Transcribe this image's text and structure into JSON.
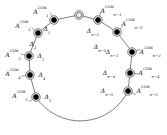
{
  "figure": {
    "kind": "ring-cycle-diagram",
    "width": 167,
    "height": 135,
    "background": "#ffffff",
    "stroke_color": "#555555",
    "node_fill": "#000000",
    "node_ring_color": "#333333",
    "text_color": "#111111"
  },
  "origin": {
    "name": "origin-node",
    "style": "hollow-double-circle",
    "cx": 79,
    "cy": 15,
    "label": ""
  },
  "nodes": [
    {
      "id": "a1",
      "cx": 54,
      "cy": 20,
      "style": "filled-ringed",
      "base": "A",
      "sub": "1",
      "sup": "COM",
      "label_dx": -13,
      "label_dy": -8
    },
    {
      "id": "a2",
      "cx": 38,
      "cy": 33,
      "style": "filled-ringed",
      "base": "A",
      "sub": "2",
      "sup": "COM",
      "label_dx": -15,
      "label_dy": -7
    },
    {
      "id": "a3",
      "cx": 29,
      "cy": 56,
      "style": "filled-ringed",
      "base": "A",
      "sub": "3",
      "sup": "COM",
      "label_dx": -16,
      "label_dy": -1
    },
    {
      "id": "a4",
      "cx": 30,
      "cy": 75,
      "style": "filled-ringed",
      "base": "A",
      "sub": "4",
      "sup": "COM",
      "label_dx": -17,
      "label_dy": -1
    },
    {
      "id": "a5",
      "cx": 36,
      "cy": 97,
      "style": "filled-ringed",
      "base": "A",
      "sub": "5",
      "sup": "COM",
      "label_dx": -16,
      "label_dy": -1
    },
    {
      "id": "an1",
      "cx": 98,
      "cy": 20,
      "style": "filled-ringed",
      "base": "A",
      "sub": "n−1",
      "sup": "COM",
      "label_dx": 13,
      "label_dy": -9
    },
    {
      "id": "an2",
      "cx": 117,
      "cy": 32,
      "style": "filled-ringed",
      "base": "A",
      "sub": "n−2",
      "sup": "COM",
      "label_dx": 15,
      "label_dy": -8
    },
    {
      "id": "an3",
      "cx": 132,
      "cy": 52,
      "style": "filled-ringed",
      "base": "A",
      "sub": "n−3",
      "sup": "COM",
      "label_dx": 18,
      "label_dy": 0
    },
    {
      "id": "an4",
      "cx": 130,
      "cy": 73,
      "style": "filled-ringed",
      "base": "A",
      "sub": "n−4",
      "sup": "COM",
      "label_dx": 19,
      "label_dy": 0
    },
    {
      "id": "an5",
      "cx": 128,
      "cy": 91,
      "style": "filled-ringed",
      "base": "A",
      "sub": "n−5",
      "sup": "COM",
      "label_dx": 19,
      "label_dy": 0
    }
  ],
  "edge_labels": [
    {
      "id": "d1",
      "base": "Δ",
      "sub": "1",
      "x": 47,
      "y": 29
    },
    {
      "id": "d2",
      "base": "Δ",
      "sub": "2",
      "x": 33,
      "y": 44
    },
    {
      "id": "d3",
      "base": "Δ",
      "sub": "3",
      "x": 41,
      "y": 56
    },
    {
      "id": "d4",
      "base": "Δ",
      "sub": "4",
      "x": 42,
      "y": 75
    },
    {
      "id": "d5",
      "base": "Δ",
      "sub": "5",
      "x": 48,
      "y": 97
    },
    {
      "id": "dn1",
      "base": "Δ",
      "sub": "n−1",
      "x": 93,
      "y": 31
    },
    {
      "id": "dn2",
      "base": "Δ",
      "sub": "n−2",
      "x": 100,
      "y": 47
    },
    {
      "id": "dn3",
      "base": "Δ",
      "sub": "n−3",
      "x": 112,
      "y": 52
    },
    {
      "id": "dn4",
      "base": "Δ",
      "sub": "n−4",
      "x": 109,
      "y": 73
    },
    {
      "id": "dn5",
      "base": "Δ",
      "sub": "n−5",
      "x": 107,
      "y": 91
    }
  ],
  "ring": {
    "cx": 80,
    "cy": 68,
    "r": 53,
    "gap_description": "open arc across the bottom with no nodes"
  }
}
